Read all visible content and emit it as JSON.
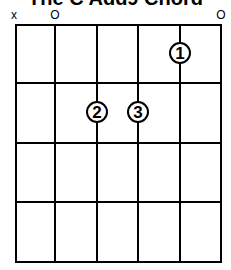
{
  "title": "The C Add9 Chord",
  "strings_markers": [
    {
      "string": 1,
      "marker": "x"
    },
    {
      "string": 2,
      "marker": "o"
    },
    {
      "string": 6,
      "marker": "o"
    }
  ],
  "grid": {
    "strings": 6,
    "frets": 4,
    "string_x": [
      16,
      55,
      97,
      138,
      180,
      221
    ],
    "fret_y": [
      25,
      83,
      143,
      202,
      262
    ]
  },
  "fingers": [
    {
      "label": "1",
      "string": 5,
      "fret": 1
    },
    {
      "label": "2",
      "string": 3,
      "fret": 2
    },
    {
      "label": "3",
      "string": 4,
      "fret": 2
    }
  ],
  "colors": {
    "line": "#000000",
    "background": "#ffffff"
  }
}
